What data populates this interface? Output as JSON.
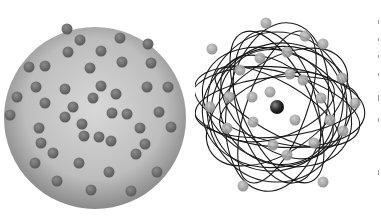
{
  "figure": {
    "left_panel": {
      "model": "uniform-sphere-with-embedded-particles",
      "sphere": {
        "cx": 95,
        "cy": 118,
        "r": 91,
        "fill_center": "#d8d8d8",
        "fill_edge": "#8a8a8a"
      },
      "particle_color": "#6e6e6e",
      "particle_radius": 5.5,
      "particles": [
        [
          67,
          29
        ],
        [
          80,
          40
        ],
        [
          120,
          38
        ],
        [
          148,
          44
        ],
        [
          68,
          52
        ],
        [
          101,
          51
        ],
        [
          29,
          67
        ],
        [
          45,
          66
        ],
        [
          90,
          68
        ],
        [
          122,
          62
        ],
        [
          151,
          63
        ],
        [
          36,
          87
        ],
        [
          65,
          89
        ],
        [
          101,
          86
        ],
        [
          116,
          94
        ],
        [
          147,
          87
        ],
        [
          168,
          87
        ],
        [
          17,
          97
        ],
        [
          45,
          103
        ],
        [
          93,
          98
        ],
        [
          73,
          107
        ],
        [
          112,
          113
        ],
        [
          127,
          114
        ],
        [
          159,
          112
        ],
        [
          10,
          115
        ],
        [
          65,
          117
        ],
        [
          82,
          124
        ],
        [
          140,
          128
        ],
        [
          171,
          127
        ],
        [
          39,
          128
        ],
        [
          84,
          136
        ],
        [
          99,
          137
        ],
        [
          111,
          141
        ],
        [
          41,
          143
        ],
        [
          53,
          153
        ],
        [
          145,
          144
        ],
        [
          136,
          154
        ],
        [
          35,
          163
        ],
        [
          79,
          163
        ],
        [
          109,
          172
        ],
        [
          157,
          172
        ],
        [
          57,
          181
        ],
        [
          91,
          190
        ],
        [
          131,
          191
        ]
      ]
    },
    "right_panel": {
      "model": "nucleus-with-electron-orbits",
      "nucleus": {
        "cx": 82,
        "cy": 107,
        "r": 7,
        "color": "#2a2a2a"
      },
      "orbit_color": "#1a1a1a",
      "electron_color": "#9a9a9a",
      "electron_radius": 5.5,
      "electrons": [
        [
          71,
          23
        ],
        [
          17,
          49
        ],
        [
          110,
          36
        ],
        [
          128,
          44
        ],
        [
          92,
          52
        ],
        [
          65,
          58
        ],
        [
          45,
          70
        ],
        [
          95,
          74
        ],
        [
          108,
          80
        ],
        [
          147,
          78
        ],
        [
          75,
          92
        ],
        [
          34,
          97
        ],
        [
          57,
          97
        ],
        [
          126,
          98
        ],
        [
          15,
          107
        ],
        [
          160,
          103
        ],
        [
          100,
          120
        ],
        [
          58,
          122
        ],
        [
          135,
          120
        ],
        [
          32,
          128
        ],
        [
          148,
          131
        ],
        [
          78,
          145
        ],
        [
          119,
          143
        ],
        [
          92,
          155
        ],
        [
          48,
          186
        ],
        [
          128,
          182
        ]
      ],
      "orbits": [
        [
          82,
          107,
          75,
          60,
          -10
        ],
        [
          82,
          107,
          85,
          35,
          15
        ],
        [
          82,
          107,
          70,
          75,
          0
        ],
        [
          82,
          107,
          30,
          80,
          20
        ],
        [
          82,
          107,
          35,
          82,
          -25
        ],
        [
          82,
          107,
          80,
          45,
          -35
        ],
        [
          82,
          107,
          65,
          40,
          40
        ],
        [
          82,
          107,
          25,
          70,
          -60
        ],
        [
          82,
          107,
          78,
          55,
          25
        ],
        [
          82,
          107,
          50,
          85,
          10
        ],
        [
          82,
          107,
          82,
          30,
          -5
        ],
        [
          82,
          107,
          40,
          78,
          -15
        ],
        [
          82,
          107,
          62,
          68,
          55
        ],
        [
          82,
          107,
          88,
          40,
          5
        ],
        [
          82,
          107,
          55,
          60,
          -45
        ],
        [
          82,
          107,
          30,
          60,
          70
        ]
      ]
    },
    "edge_marks": [
      [
        20,
        4
      ],
      [
        38,
        3
      ],
      [
        55,
        3
      ],
      [
        73,
        3
      ],
      [
        95,
        6
      ],
      [
        118,
        4
      ],
      [
        170,
        5
      ]
    ]
  }
}
